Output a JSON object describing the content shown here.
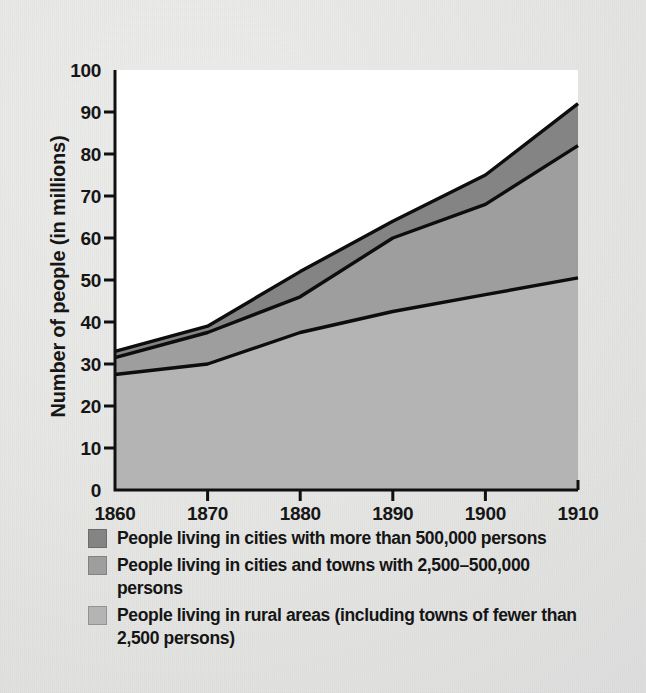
{
  "figure": {
    "background_color": "#e8e8e6",
    "plot_background_color": "#ffffff"
  },
  "chart_data": {
    "type": "area",
    "title": "",
    "xlabel": "",
    "ylabel": "Number of people (in millions)",
    "x": [
      1860,
      1870,
      1880,
      1890,
      1900,
      1910
    ],
    "xticklabels": [
      "1860",
      "1870",
      "1880",
      "1890",
      "1900",
      "1910"
    ],
    "yticklabels": [
      "0",
      "10",
      "20",
      "30",
      "40",
      "50",
      "60",
      "70",
      "80",
      "90",
      "100"
    ],
    "yticks": [
      0,
      10,
      20,
      30,
      40,
      50,
      60,
      70,
      80,
      90,
      100
    ],
    "xlim": [
      1860,
      1910
    ],
    "ylim": [
      0,
      100
    ],
    "grid": false,
    "stacked": true,
    "legend_position": "below",
    "series": [
      {
        "name": "People living in rural areas (including towns of fewer than 2,500 persons)",
        "color": "#b4b4b4",
        "values": [
          27.5,
          30.0,
          37.5,
          42.5,
          46.5,
          50.5
        ],
        "cumulative": [
          27.5,
          30.0,
          37.5,
          42.5,
          46.5,
          50.5
        ]
      },
      {
        "name": "People living in cities and towns with 2,500–500,000 persons",
        "color": "#9e9e9e",
        "values": [
          4.0,
          7.5,
          8.5,
          17.5,
          21.5,
          31.5
        ],
        "cumulative": [
          31.5,
          37.5,
          46.0,
          60.0,
          68.0,
          82.0
        ]
      },
      {
        "name": "People living in cities with more than 500,000 persons",
        "color": "#848484",
        "values": [
          1.5,
          1.5,
          6.0,
          4.0,
          7.0,
          10.0
        ],
        "cumulative": [
          33.0,
          39.0,
          52.0,
          64.0,
          75.0,
          92.0
        ]
      }
    ]
  },
  "legend": {
    "items": [
      {
        "swatch_color": "#848484",
        "label": "People living in cities with more than 500,000 persons"
      },
      {
        "swatch_color": "#9e9e9e",
        "label": "People living in cities and towns with 2,500–500,000 persons"
      },
      {
        "swatch_color": "#b4b4b4",
        "label": "People living in rural areas (including towns of fewer than 2,500 persons)"
      }
    ]
  },
  "axes": {
    "y_axis_title": "Number of people (in millions)"
  }
}
